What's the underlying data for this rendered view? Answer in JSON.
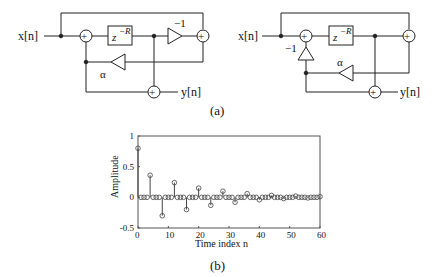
{
  "diagram_a": {
    "left": {
      "input": "x[n]",
      "output": "y[n]",
      "delay": "z",
      "delay_exp": "−R",
      "gain1": "−1",
      "gain2": "α"
    },
    "right": {
      "input": "x[n]",
      "output": "y[n]",
      "delay": "z",
      "delay_exp": "−R",
      "gain1": "−1",
      "gain2": "α"
    },
    "caption": "(a)"
  },
  "chart_data": {
    "type": "stem",
    "xlabel": "Time index n",
    "ylabel": "Amplitude",
    "xlim": [
      0,
      60
    ],
    "ylim": [
      -0.5,
      1
    ],
    "xticks": [
      0,
      10,
      20,
      30,
      40,
      50,
      60
    ],
    "yticks": [
      -0.5,
      0,
      0.5,
      1
    ],
    "ytick_labels": [
      "-0.5",
      "0",
      "0.5",
      "1"
    ],
    "x": [
      0,
      4,
      8,
      12,
      16,
      20,
      24,
      28,
      32,
      36,
      40,
      44,
      48,
      52,
      56,
      60
    ],
    "y": [
      0.8,
      0.36,
      -0.3,
      0.24,
      -0.2,
      0.15,
      -0.13,
      0.1,
      -0.08,
      0.06,
      -0.04,
      0.03,
      -0.02,
      0.02,
      -0.01,
      0.01
    ],
    "caption": "(b)"
  }
}
